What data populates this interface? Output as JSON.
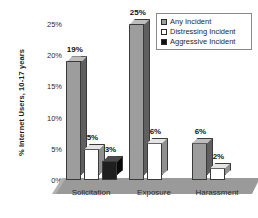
{
  "chart_data": {
    "type": "bar",
    "title": "",
    "xlabel": "",
    "ylabel": "% Internet Users, 10-17 years",
    "ylim": [
      0,
      25
    ],
    "ytick_labels": [
      "0%",
      "5%",
      "10%",
      "15%",
      "20%",
      "25%"
    ],
    "ytick_values": [
      0,
      5,
      10,
      15,
      20,
      25
    ],
    "grid": false,
    "legend_position": "top-right",
    "categories": [
      "Solicitation",
      "Exposure",
      "Harassment"
    ],
    "series": [
      {
        "name": "Any Incident",
        "color": "#9d9d9d",
        "values": [
          19,
          25,
          6
        ],
        "labels": [
          "19%",
          "25%",
          "6%"
        ]
      },
      {
        "name": "Distressing Incident",
        "color": "#ffffff",
        "values": [
          5,
          6,
          2
        ],
        "labels": [
          "5%",
          "6%",
          "2%"
        ]
      },
      {
        "name": "Aggressive Incident",
        "color": "#101010",
        "values": [
          3,
          null,
          null
        ],
        "labels": [
          "3%",
          "",
          ""
        ]
      }
    ]
  },
  "legend": {
    "items": [
      {
        "label": "Any Incident",
        "swatch": "filled-gray-square-icon"
      },
      {
        "label": "Distressing Incident",
        "swatch": "outlined-white-square-icon"
      },
      {
        "label": "Aggressive Incident",
        "swatch": "filled-black-square-icon"
      }
    ]
  }
}
